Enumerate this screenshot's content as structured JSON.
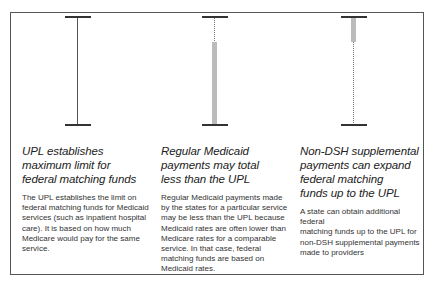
{
  "columns": [
    {
      "heading": [
        "UPL establishes",
        "maximum limit for",
        "federal matching funds"
      ],
      "body": [
        "The UPL establishes the limit on",
        "federal matching funds for Medicaid",
        "services (such as inpatient hospital",
        "care). It is based on how much",
        "Medicare would pay for the same",
        "service."
      ],
      "bar": {
        "type": "full-line",
        "grey_fill": "none"
      }
    },
    {
      "heading": [
        "Regular Medicaid",
        "payments may total",
        "less than the UPL"
      ],
      "body": [
        "Regular Medicaid payments made",
        "by the states for a particular service",
        "may be less than the UPL because",
        "Medicaid rates are often lower than",
        "Medicare rates for a comparable",
        "service. In that case, federal",
        "matching funds are based on",
        "Medicaid rates."
      ],
      "bar": {
        "type": "dotted-top-grey-bottom",
        "grey_fill": "lower portion"
      }
    },
    {
      "heading": [
        "Non-DSH supplemental",
        "payments can expand",
        "federal matching",
        "funds up to the UPL"
      ],
      "body": [
        "A state can obtain additional federal",
        "matching funds up to the UPL for",
        "non-DSH supplemental payments",
        "made to providers"
      ],
      "bar": {
        "type": "grey-top-dotted-bottom",
        "grey_fill": "upper portion"
      }
    }
  ],
  "colors": {
    "border": "#555555",
    "cap": "#333333",
    "grey_bar": "#bbbbbb",
    "text": "#222222"
  }
}
